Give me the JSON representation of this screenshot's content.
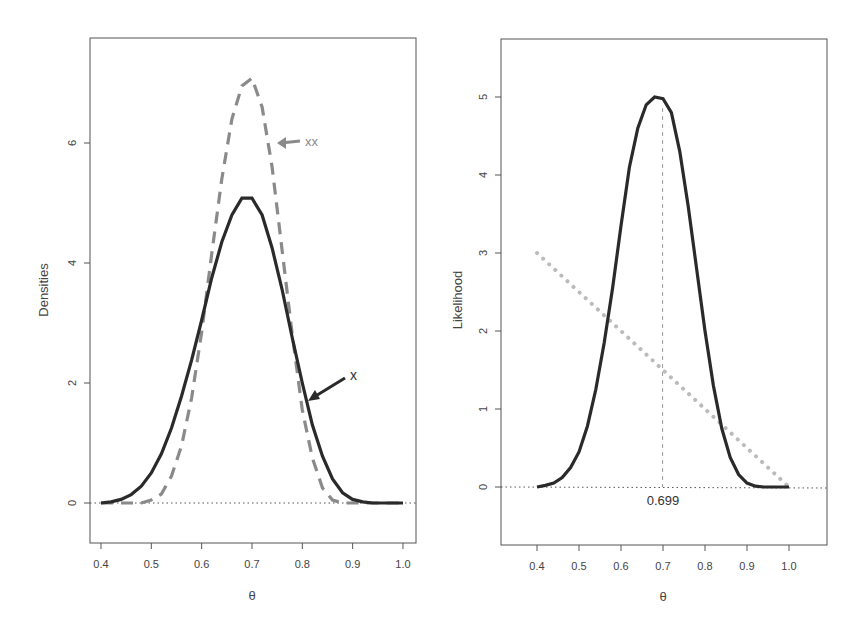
{
  "chart_data": [
    {
      "type": "line",
      "title": "",
      "xlabel": "θ",
      "ylabel": "Densities",
      "xlim": [
        0.38,
        1.03
      ],
      "ylim": [
        -0.67,
        7.75
      ],
      "x_ticks": [
        "0.4",
        "0.5",
        "0.6",
        "0.7",
        "0.8",
        "0.9",
        "1.0"
      ],
      "y_ticks": [
        "0",
        "2",
        "4",
        "6"
      ],
      "grid": false,
      "legend": "none",
      "reference_line": {
        "y": 0,
        "style": "dotted"
      },
      "x": [
        0.4,
        0.42,
        0.44,
        0.46,
        0.48,
        0.5,
        0.52,
        0.54,
        0.56,
        0.58,
        0.6,
        0.62,
        0.64,
        0.66,
        0.68,
        0.7,
        0.72,
        0.74,
        0.76,
        0.78,
        0.8,
        0.82,
        0.84,
        0.86,
        0.88,
        0.9,
        0.92,
        0.94,
        0.96,
        0.98,
        1.0
      ],
      "series": [
        {
          "name": "x",
          "style": "solid",
          "color": "#2a2a2a",
          "values": [
            0.0,
            0.02,
            0.06,
            0.14,
            0.28,
            0.5,
            0.82,
            1.25,
            1.78,
            2.38,
            3.05,
            3.75,
            4.35,
            4.8,
            5.08,
            5.08,
            4.8,
            4.25,
            3.55,
            2.75,
            2.0,
            1.3,
            0.78,
            0.4,
            0.17,
            0.06,
            0.02,
            0.0,
            0.0,
            0.0,
            0.0
          ]
        },
        {
          "name": "xx",
          "style": "dashed",
          "color": "#8a8a8a",
          "values": [
            0.0,
            0.0,
            0.0,
            0.0,
            0.0,
            0.05,
            0.15,
            0.45,
            0.95,
            1.75,
            2.85,
            4.15,
            5.4,
            6.4,
            6.95,
            7.08,
            6.6,
            5.6,
            4.2,
            2.8,
            1.55,
            0.75,
            0.25,
            0.05,
            0.0,
            0.0,
            0.0,
            0.0,
            0.0,
            0.0,
            0.0
          ]
        }
      ],
      "annotations": [
        {
          "text": "xx",
          "arrow_to": [
            0.755,
            6.0
          ],
          "color": "#8a8a8a"
        },
        {
          "text": "x",
          "arrow_to": [
            0.81,
            1.7
          ],
          "color": "#2a2a2a"
        }
      ]
    },
    {
      "type": "line",
      "title": "",
      "xlabel": "θ",
      "ylabel": "Likelihood",
      "xlim": [
        0.31,
        1.09
      ],
      "ylim": [
        -0.73,
        5.75
      ],
      "x_ticks": [
        "0.4",
        "0.5",
        "0.6",
        "0.7",
        "0.8",
        "0.9",
        "1.0"
      ],
      "y_ticks": [
        "0",
        "1",
        "2",
        "3",
        "4",
        "5"
      ],
      "grid": false,
      "legend": "none",
      "reference_line": {
        "y": 0,
        "style": "dotted"
      },
      "x": [
        0.4,
        0.42,
        0.44,
        0.46,
        0.48,
        0.5,
        0.52,
        0.54,
        0.56,
        0.58,
        0.6,
        0.62,
        0.64,
        0.66,
        0.68,
        0.7,
        0.72,
        0.74,
        0.76,
        0.78,
        0.8,
        0.82,
        0.84,
        0.86,
        0.88,
        0.9,
        0.92,
        0.94,
        0.96,
        0.98,
        1.0
      ],
      "series": [
        {
          "name": "likelihood",
          "style": "solid",
          "color": "#2a2a2a",
          "values": [
            0.0,
            0.02,
            0.05,
            0.12,
            0.25,
            0.45,
            0.78,
            1.25,
            1.85,
            2.55,
            3.35,
            4.1,
            4.6,
            4.9,
            5.0,
            4.98,
            4.8,
            4.3,
            3.6,
            2.8,
            2.0,
            1.3,
            0.75,
            0.38,
            0.16,
            0.05,
            0.01,
            0.0,
            0.0,
            0.0,
            0.0
          ]
        },
        {
          "name": "prior",
          "style": "dotted",
          "color": "#b5b5b5",
          "values": [
            3.0,
            2.9,
            2.8,
            2.7,
            2.6,
            2.5,
            2.4,
            2.3,
            2.2,
            2.1,
            2.0,
            1.9,
            1.8,
            1.7,
            1.6,
            1.5,
            1.4,
            1.3,
            1.2,
            1.1,
            1.0,
            0.9,
            0.8,
            0.7,
            0.6,
            0.5,
            0.4,
            0.3,
            0.2,
            0.1,
            0.0
          ]
        }
      ],
      "annotations": [
        {
          "text": "0.699",
          "vline_x": 0.699,
          "style": "dashed"
        }
      ]
    }
  ],
  "labels": {
    "left_ylabel": "Densities",
    "left_xlabel": "θ",
    "left_ann_xx": "xx",
    "left_ann_x": "x",
    "right_ylabel": "Likelihood",
    "right_xlabel": "θ",
    "right_mode": "0.699"
  }
}
